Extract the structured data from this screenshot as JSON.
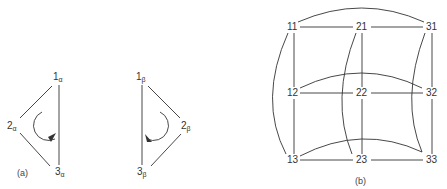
{
  "figure": {
    "part_a": {
      "caption": "(a)",
      "nodes": [
        {
          "id": "1a",
          "base": "1",
          "sub": "α"
        },
        {
          "id": "2a",
          "base": "2",
          "sub": "α"
        },
        {
          "id": "3a",
          "base": "3",
          "sub": "α"
        }
      ],
      "rotation": "counterclockwise"
    },
    "part_a_beta": {
      "nodes": [
        {
          "id": "1b",
          "base": "1",
          "sub": "β"
        },
        {
          "id": "2b",
          "base": "2",
          "sub": "β"
        },
        {
          "id": "3b",
          "base": "3",
          "sub": "β"
        }
      ],
      "rotation": "clockwise"
    },
    "part_b": {
      "caption": "(b)",
      "grid_labels": [
        [
          "11",
          "21",
          "31"
        ],
        [
          "12",
          "22",
          "32"
        ],
        [
          "13",
          "23",
          "33"
        ]
      ]
    }
  },
  "colors": {
    "line": "#333333",
    "text": "#333333",
    "background": "#ffffff"
  }
}
